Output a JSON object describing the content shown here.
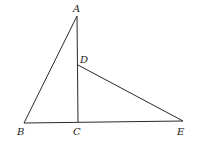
{
  "diagram": {
    "type": "geometry-figure",
    "points": {
      "A": {
        "label": "A",
        "x": 77,
        "y": 16
      },
      "B": {
        "label": "B",
        "x": 24,
        "y": 123
      },
      "C": {
        "label": "C",
        "x": 78,
        "y": 122
      },
      "D": {
        "label": "D",
        "x": 78,
        "y": 65
      },
      "E": {
        "label": "E",
        "x": 183,
        "y": 121
      }
    },
    "segments": [
      {
        "from": "A",
        "to": "B"
      },
      {
        "from": "A",
        "to": "C"
      },
      {
        "from": "B",
        "to": "E"
      },
      {
        "from": "D",
        "to": "E"
      }
    ],
    "labels": {
      "A": "A",
      "B": "B",
      "C": "C",
      "D": "D",
      "E": "E"
    },
    "colors": {
      "line": "#2a2a2a",
      "text": "#222222",
      "background": "#ffffff"
    }
  }
}
